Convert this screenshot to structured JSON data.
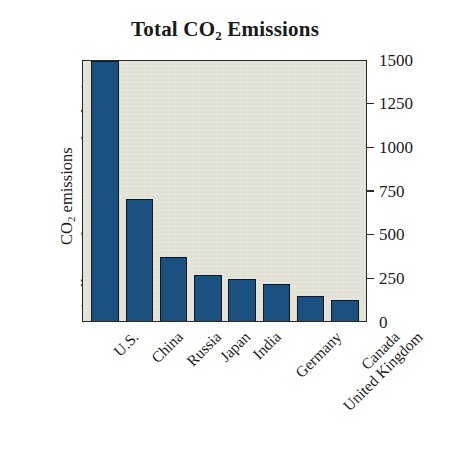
{
  "chart_data": {
    "type": "bar",
    "title": "Total CO2 Emissions",
    "title_parts": {
      "pre": "Total CO",
      "sub": "2",
      "post": " Emissions"
    },
    "xlabel": "",
    "ylabel": "CO2 emissions (millions of metric tons of carbon)",
    "ylabel_lines": [
      {
        "pre": "CO",
        "sub": "2",
        "post": " emissions"
      },
      {
        "pre": "(millions of metric tons of carbon)",
        "sub": "",
        "post": ""
      }
    ],
    "categories": [
      "U.S.",
      "China",
      "Russia",
      "Japan",
      "India",
      "Germany",
      "United Kingdom",
      "Canada"
    ],
    "values": [
      1500,
      705,
      370,
      265,
      240,
      212,
      143,
      120
    ],
    "ylim": [
      0,
      1500
    ],
    "yticks": [
      0,
      250,
      500,
      750,
      1000,
      1250,
      1500
    ],
    "ytick_labels": [
      "0",
      "250",
      "500",
      "750",
      "1000",
      "1250",
      "1500"
    ],
    "grid": false,
    "legend": "none",
    "axis_position": "right",
    "bar_color": "#1b5180",
    "bar_edge_color": "#16161c",
    "plot_background": "#e6e5da",
    "figure_background": "#ffffff",
    "xtick_rotation": 45
  }
}
